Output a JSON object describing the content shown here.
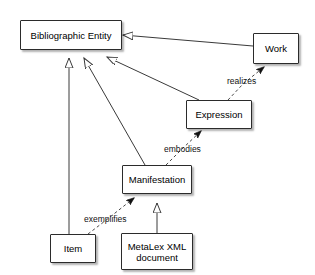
{
  "diagram": {
    "type": "uml-class-diagram",
    "background_color": "#ffffff",
    "line_color": "#3a3a3a",
    "node_fill": "#ffffff",
    "node_border": "#2b2b2b",
    "text_color": "#000000",
    "nodes": [
      {
        "id": "bibliographic-entity",
        "label": "Bibliographic Entity",
        "x": 20,
        "y": 20,
        "w": 102,
        "h": 30
      },
      {
        "id": "work",
        "label": "Work",
        "x": 253,
        "y": 33,
        "w": 46,
        "h": 31
      },
      {
        "id": "expression",
        "label": "Expression",
        "x": 186,
        "y": 100,
        "w": 66,
        "h": 29
      },
      {
        "id": "manifestation",
        "label": "Manifestation",
        "x": 122,
        "y": 165,
        "w": 70,
        "h": 29
      },
      {
        "id": "item",
        "label": "Item",
        "x": 50,
        "y": 234,
        "w": 46,
        "h": 29
      },
      {
        "id": "metalex-xml-document",
        "label": "MetaLex XML\ndocument",
        "x": 121,
        "y": 233,
        "w": 72,
        "h": 37
      }
    ],
    "edges": [
      {
        "id": "work-generalizes-bibliographic-entity",
        "from": "work",
        "to": "bibliographic-entity",
        "relation": "generalization",
        "style": "solid",
        "arrowhead": "hollow-triangle",
        "label": ""
      },
      {
        "id": "expression-generalizes-bibliographic-entity",
        "from": "expression",
        "to": "bibliographic-entity",
        "relation": "generalization",
        "style": "solid",
        "arrowhead": "hollow-triangle",
        "label": ""
      },
      {
        "id": "manifestation-generalizes-bibliographic-entity",
        "from": "manifestation",
        "to": "bibliographic-entity",
        "relation": "generalization",
        "style": "solid",
        "arrowhead": "hollow-triangle",
        "label": ""
      },
      {
        "id": "item-generalizes-bibliographic-entity",
        "from": "item",
        "to": "bibliographic-entity",
        "relation": "generalization",
        "style": "solid",
        "arrowhead": "hollow-triangle",
        "label": ""
      },
      {
        "id": "metalex-generalizes-manifestation",
        "from": "metalex-xml-document",
        "to": "manifestation",
        "relation": "generalization",
        "style": "solid",
        "arrowhead": "hollow-triangle",
        "label": ""
      },
      {
        "id": "expression-realizes-work",
        "from": "expression",
        "to": "work",
        "relation": "dependency",
        "style": "dashed",
        "arrowhead": "filled-arrow",
        "label": "realizes",
        "label_x": 227,
        "label_y": 76
      },
      {
        "id": "manifestation-embodies-expression",
        "from": "manifestation",
        "to": "expression",
        "relation": "dependency",
        "style": "dashed",
        "arrowhead": "filled-arrow",
        "label": "embodies",
        "label_x": 164,
        "label_y": 144
      },
      {
        "id": "item-exemplifies-manifestation",
        "from": "item",
        "to": "manifestation",
        "relation": "dependency",
        "style": "dashed",
        "arrowhead": "filled-arrow",
        "label": "exemplifies",
        "label_x": 84,
        "label_y": 214
      }
    ]
  }
}
